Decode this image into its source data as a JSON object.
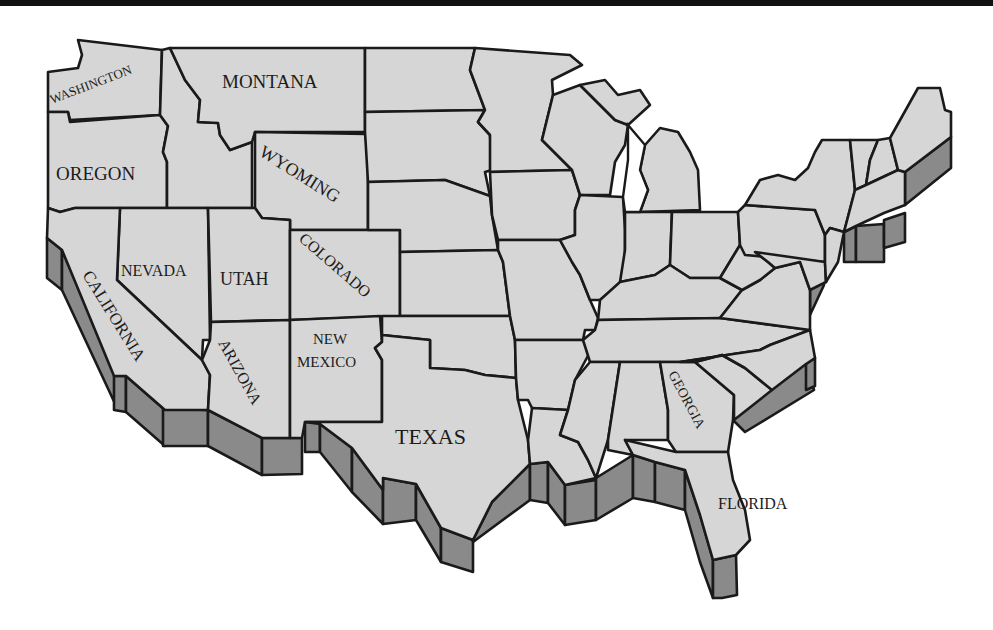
{
  "map": {
    "title": "United States map",
    "colors": {
      "land": "#d6d6d6",
      "coast_wall": "#8a8a8a",
      "border": "#1a1a1a",
      "background": "#ffffff"
    },
    "labels": [
      {
        "id": "washington",
        "text": "WASHINGTON",
        "x": 52,
        "y": 104,
        "size": 13,
        "rotate": -21
      },
      {
        "id": "montana",
        "text": "MONTANA",
        "x": 222,
        "y": 88,
        "size": 19,
        "rotate": 0
      },
      {
        "id": "oregon",
        "text": "OREGON",
        "x": 56,
        "y": 180,
        "size": 19,
        "rotate": 0
      },
      {
        "id": "wyoming",
        "text": "WYOMING",
        "x": 258,
        "y": 155,
        "size": 18,
        "rotate": 32
      },
      {
        "id": "nevada",
        "text": "NEVADA",
        "x": 121,
        "y": 276,
        "size": 16,
        "rotate": 0
      },
      {
        "id": "utah",
        "text": "UTAH",
        "x": 220,
        "y": 285,
        "size": 18,
        "rotate": 0
      },
      {
        "id": "colorado",
        "text": "COLORADO",
        "x": 298,
        "y": 240,
        "size": 16,
        "rotate": 41
      },
      {
        "id": "california",
        "text": "CALIFORNIA",
        "x": 82,
        "y": 275,
        "size": 17,
        "rotate": 58
      },
      {
        "id": "arizona",
        "text": "ARIZONA",
        "x": 218,
        "y": 343,
        "size": 16,
        "rotate": 61
      },
      {
        "id": "new-mexico-1",
        "text": "NEW",
        "x": 313,
        "y": 344,
        "size": 15,
        "rotate": 0
      },
      {
        "id": "new-mexico-2",
        "text": "MEXICO",
        "x": 297,
        "y": 367,
        "size": 15,
        "rotate": 0
      },
      {
        "id": "texas",
        "text": "TEXAS",
        "x": 395,
        "y": 444,
        "size": 22,
        "rotate": 0
      },
      {
        "id": "georgia",
        "text": "GEORGIA",
        "x": 668,
        "y": 374,
        "size": 14,
        "rotate": 62
      },
      {
        "id": "florida",
        "text": "FLORIDA",
        "x": 718,
        "y": 509,
        "size": 16,
        "rotate": 0
      }
    ]
  }
}
